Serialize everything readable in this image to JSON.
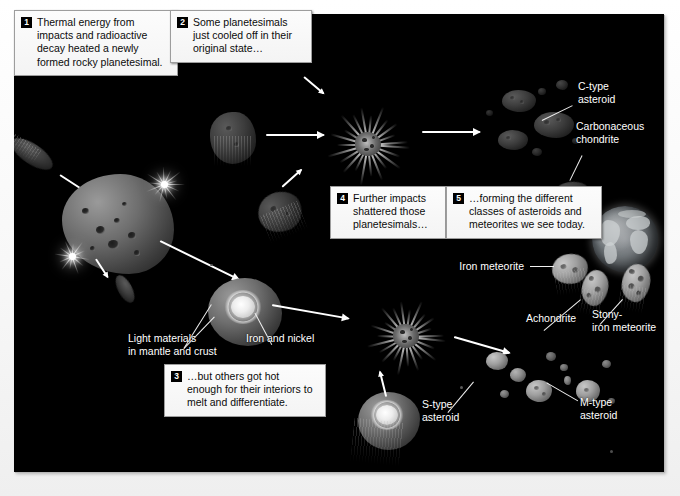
{
  "figure": {
    "background_color": "#000000",
    "paper_color": "#ffffff"
  },
  "captions": [
    {
      "number": "1",
      "text": "Thermal energy from impacts and radioactive decay heated a newly formed rocky planetesimal."
    },
    {
      "number": "2",
      "text": "Some planetesimals just cooled off in their original state…"
    },
    {
      "number": "3",
      "text": "…but others got hot enough for their interiors to melt and differentiate."
    },
    {
      "number": "4",
      "text": "Further impacts shattered those planetesimals…"
    },
    {
      "number": "5",
      "text": "…forming the different classes of asteroids and meteorites we see today."
    }
  ],
  "labels": {
    "c_type_asteroid": "C-type\nasteroid",
    "carbonaceous_chondrite": "Carbonaceous\nchondrite",
    "iron_meteorite": "Iron meteorite",
    "achondrite": "Achondrite",
    "stony_iron_meteorite": "Stony-\niron meteorite",
    "s_type_asteroid": "S-type\nasteroid",
    "m_type_asteroid": "M-type\nasteroid",
    "light_materials": "Light materials\nin mantle and crust",
    "iron_and_nickel": "Iron and nickel"
  },
  "colors": {
    "plate": "#000000",
    "arrow": "#ffffff",
    "label_text": "#ffffff",
    "caption_bg": "#f7f7f7",
    "caption_border": "#9d9d9d",
    "badge_bg": "#000000",
    "badge_text": "#ffffff"
  }
}
